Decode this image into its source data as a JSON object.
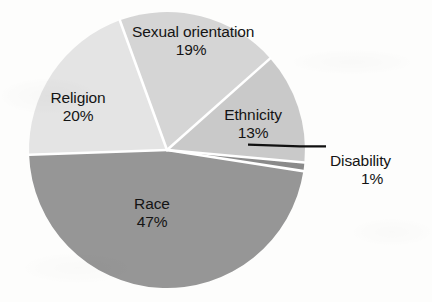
{
  "chart_data": {
    "type": "pie",
    "title": "",
    "subtitle": "",
    "xlabel": "",
    "ylabel": "",
    "legend_position": "none",
    "grid": false,
    "value_unit": "percent",
    "categories": [
      "Sexual orientation",
      "Ethnicity",
      "Disability",
      "Race",
      "Religion"
    ],
    "values": [
      19,
      13,
      1,
      47,
      20
    ],
    "slices": [
      {
        "label": "Sexual orientation",
        "value": 19,
        "value_label": "19%",
        "color": "#d5d5d5",
        "label_placement": "inside",
        "leader_line": false
      },
      {
        "label": "Ethnicity",
        "value": 13,
        "value_label": "13%",
        "color": "#c9c9c9",
        "label_placement": "inside",
        "leader_line": false
      },
      {
        "label": "Disability",
        "value": 1,
        "value_label": "1%",
        "color": "#8a8a8a",
        "label_placement": "outside",
        "leader_line": true
      },
      {
        "label": "Race",
        "value": 47,
        "value_label": "47%",
        "color": "#969696",
        "label_placement": "inside",
        "leader_line": false
      },
      {
        "label": "Religion",
        "value": 20,
        "value_label": "20%",
        "color": "#e4e4e4",
        "label_placement": "inside",
        "leader_line": false
      }
    ]
  },
  "colors": {
    "background": "#fdfdfc",
    "text": "#141414",
    "separator": "#ffffff",
    "leader_line": "#101010"
  }
}
